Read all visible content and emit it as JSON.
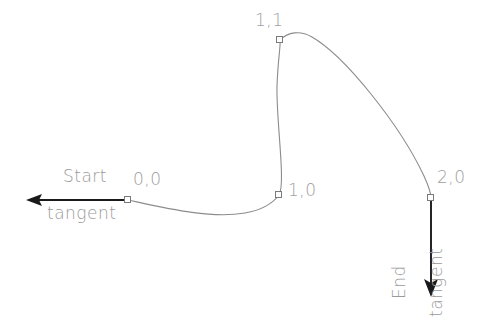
{
  "diagram": {
    "background_color": "#ffffff",
    "curve_color": "#8c8c8c",
    "arrow_color": "#1a1a1a",
    "text_color": "#9a9a9a",
    "marker_color": "#8c8c8c",
    "labels": {
      "start": "Start",
      "tangent": "tangent",
      "end": "End",
      "end_tangent": "tangent",
      "point_0_0": "0,0",
      "point_1_1": "1,1",
      "point_1_0": "1,0",
      "point_2_0": "2,0"
    },
    "control_points": [
      {
        "name": "0,0",
        "x": 128,
        "y": 200
      },
      {
        "name": "1,0",
        "x": 279,
        "y": 195
      },
      {
        "name": "1,1",
        "x": 280,
        "y": 40
      },
      {
        "name": "2,0",
        "x": 431,
        "y": 198
      }
    ],
    "curve_path": "M 128 200 C 165 208 210 219 245 213 C 262 210 273 203 279 195 C 286 184 276 120 277 86 C 278 58 281 44 280 40 C 288 32 300 30 312 37 C 345 56 400 125 424 176 C 429 187 431 194 431 198",
    "start_tangent": {
      "from_x": 128,
      "from_y": 200,
      "to_x": 27,
      "to_y": 200,
      "direction": "left"
    },
    "end_tangent": {
      "from_x": 431,
      "from_y": 198,
      "to_x": 431,
      "to_y": 296,
      "direction": "down"
    }
  }
}
